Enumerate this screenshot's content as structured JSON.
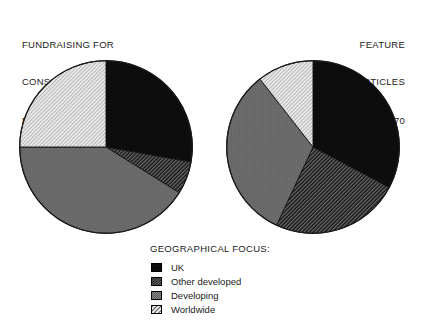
{
  "panels": [
    {
      "title_lines": [
        "FUNDRAISING FOR",
        "CONSERVATION"
      ],
      "n_label": "N = 23",
      "align": "left"
    },
    {
      "title_lines": [
        "FEATURE",
        "ARTICLES"
      ],
      "n_label": "N = 70",
      "align": "right"
    }
  ],
  "legend": {
    "title": "GEOGRAPHICAL FOCUS:",
    "items": [
      {
        "label": "UK",
        "fill": "#0d0d0d",
        "pattern": "solid-black"
      },
      {
        "label": "Other developed",
        "fill": "#3a3a3a",
        "pattern": "dark-diagonal-hatch"
      },
      {
        "label": "Developing",
        "fill": "#6e6e6e",
        "pattern": "medium-gray-texture"
      },
      {
        "label": "Worldwide",
        "fill": "#dcdcdc",
        "pattern": "light-diagonal-hatch"
      }
    ]
  },
  "chart_data": [
    {
      "type": "pie",
      "title": "FUNDRAISING FOR CONSERVATION",
      "n": 23,
      "n_label": "N = 23",
      "legend_title": "GEOGRAPHICAL FOCUS:",
      "legend_position": "bottom-center",
      "start_angle_deg": 0,
      "direction": "clockwise",
      "categories": [
        "UK",
        "Other developed",
        "Developing",
        "Worldwide"
      ],
      "values": [
        27.8,
        6.1,
        41.1,
        25.0
      ],
      "value_unit": "percent",
      "angles_deg": [
        100,
        22,
        148,
        90
      ],
      "slice_start_deg": [
        0,
        100,
        122,
        270
      ],
      "slice_end_deg": [
        100,
        122,
        270,
        360
      ],
      "colors": [
        "#0d0d0d",
        "#3a3a3a",
        "#6e6e6e",
        "#dcdcdc"
      ]
    },
    {
      "type": "pie",
      "title": "FEATURE ARTICLES",
      "n": 70,
      "n_label": "N = 70",
      "legend_title": "GEOGRAPHICAL FOCUS:",
      "legend_position": "bottom-center",
      "start_angle_deg": 0,
      "direction": "clockwise",
      "categories": [
        "UK",
        "Other developed",
        "Developing",
        "Worldwide"
      ],
      "values": [
        32.8,
        24.2,
        32.5,
        10.5
      ],
      "value_unit": "percent",
      "angles_deg": [
        118,
        87,
        117,
        38
      ],
      "slice_start_deg": [
        0,
        118,
        205,
        322
      ],
      "slice_end_deg": [
        118,
        205,
        322,
        360
      ],
      "colors": [
        "#0d0d0d",
        "#3a3a3a",
        "#6e6e6e",
        "#dcdcdc"
      ]
    }
  ]
}
